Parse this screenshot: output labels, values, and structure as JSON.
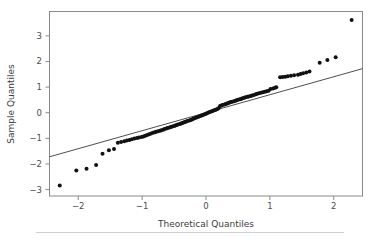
{
  "chart_data": {
    "type": "scatter",
    "title": "",
    "subtitle": "",
    "xlabel": "Theoretical Quantiles",
    "ylabel": "Sample Quantiles",
    "xlim": [
      -2.45,
      2.45
    ],
    "ylim": [
      -3.25,
      3.95
    ],
    "xticks": [
      -2,
      -1,
      0,
      1,
      2
    ],
    "xticklabels": [
      "−2",
      "−1",
      "0",
      "1",
      "2"
    ],
    "yticks": [
      -3,
      -2,
      -1,
      0,
      1,
      2,
      3
    ],
    "yticklabels": [
      "−3",
      "−2",
      "−1",
      "0",
      "1",
      "2",
      "3"
    ],
    "grid": false,
    "legend": "none",
    "marker_color": "#111111",
    "marker_size": 4,
    "line_color": "#3a3a3a",
    "reference_line": {
      "name": "qq-reference-line",
      "x": [
        -2.45,
        2.45
      ],
      "y": [
        -1.72,
        1.72
      ],
      "slope": 0.702,
      "intercept": 0.0
    },
    "series": [
      {
        "name": "sample-quantiles",
        "points": [
          [
            -2.29,
            -2.84
          ],
          [
            -2.03,
            -2.25
          ],
          [
            -1.87,
            -2.19
          ],
          [
            -1.72,
            -2.04
          ],
          [
            -1.62,
            -1.6
          ],
          [
            -1.52,
            -1.46
          ],
          [
            -1.44,
            -1.42
          ],
          [
            -1.38,
            -1.17
          ],
          [
            -1.33,
            -1.14
          ],
          [
            -1.28,
            -1.11
          ],
          [
            -1.24,
            -1.08
          ],
          [
            -1.2,
            -1.06
          ],
          [
            -1.16,
            -1.04
          ],
          [
            -1.12,
            -1.01
          ],
          [
            -1.08,
            -0.99
          ],
          [
            -1.05,
            -0.97
          ],
          [
            -1.01,
            -0.95
          ],
          [
            -0.98,
            -0.93
          ],
          [
            -0.95,
            -0.9
          ],
          [
            -0.92,
            -0.87
          ],
          [
            -0.89,
            -0.84
          ],
          [
            -0.86,
            -0.81
          ],
          [
            -0.83,
            -0.78
          ],
          [
            -0.8,
            -0.76
          ],
          [
            -0.78,
            -0.74
          ],
          [
            -0.75,
            -0.72
          ],
          [
            -0.72,
            -0.7
          ],
          [
            -0.7,
            -0.68
          ],
          [
            -0.67,
            -0.66
          ],
          [
            -0.65,
            -0.64
          ],
          [
            -0.62,
            -0.62
          ],
          [
            -0.6,
            -0.6
          ],
          [
            -0.57,
            -0.58
          ],
          [
            -0.55,
            -0.56
          ],
          [
            -0.53,
            -0.54
          ],
          [
            -0.5,
            -0.52
          ],
          [
            -0.48,
            -0.5
          ],
          [
            -0.46,
            -0.48
          ],
          [
            -0.44,
            -0.46
          ],
          [
            -0.41,
            -0.44
          ],
          [
            -0.39,
            -0.42
          ],
          [
            -0.37,
            -0.4
          ],
          [
            -0.35,
            -0.38
          ],
          [
            -0.33,
            -0.36
          ],
          [
            -0.31,
            -0.34
          ],
          [
            -0.29,
            -0.32
          ],
          [
            -0.26,
            -0.3
          ],
          [
            -0.24,
            -0.28
          ],
          [
            -0.22,
            -0.26
          ],
          [
            -0.2,
            -0.24
          ],
          [
            -0.18,
            -0.22
          ],
          [
            -0.16,
            -0.2
          ],
          [
            -0.14,
            -0.18
          ],
          [
            -0.12,
            -0.16
          ],
          [
            -0.1,
            -0.14
          ],
          [
            -0.08,
            -0.12
          ],
          [
            -0.06,
            -0.1
          ],
          [
            -0.04,
            -0.08
          ],
          [
            -0.02,
            -0.06
          ],
          [
            0.0,
            -0.04
          ],
          [
            0.02,
            -0.01
          ],
          [
            0.04,
            0.01
          ],
          [
            0.06,
            0.03
          ],
          [
            0.08,
            0.05
          ],
          [
            0.1,
            0.07
          ],
          [
            0.12,
            0.09
          ],
          [
            0.14,
            0.11
          ],
          [
            0.16,
            0.13
          ],
          [
            0.18,
            0.15
          ],
          [
            0.2,
            0.18
          ],
          [
            0.22,
            0.26
          ],
          [
            0.24,
            0.28
          ],
          [
            0.26,
            0.3
          ],
          [
            0.29,
            0.32
          ],
          [
            0.31,
            0.34
          ],
          [
            0.33,
            0.36
          ],
          [
            0.35,
            0.38
          ],
          [
            0.37,
            0.4
          ],
          [
            0.39,
            0.42
          ],
          [
            0.41,
            0.43
          ],
          [
            0.44,
            0.45
          ],
          [
            0.46,
            0.47
          ],
          [
            0.48,
            0.49
          ],
          [
            0.5,
            0.51
          ],
          [
            0.53,
            0.53
          ],
          [
            0.55,
            0.54
          ],
          [
            0.57,
            0.56
          ],
          [
            0.6,
            0.58
          ],
          [
            0.62,
            0.6
          ],
          [
            0.65,
            0.62
          ],
          [
            0.67,
            0.63
          ],
          [
            0.7,
            0.65
          ],
          [
            0.72,
            0.67
          ],
          [
            0.75,
            0.69
          ],
          [
            0.78,
            0.72
          ],
          [
            0.8,
            0.74
          ],
          [
            0.83,
            0.76
          ],
          [
            0.86,
            0.78
          ],
          [
            0.89,
            0.8
          ],
          [
            0.92,
            0.82
          ],
          [
            0.95,
            0.84
          ],
          [
            0.98,
            0.86
          ],
          [
            1.01,
            0.93
          ],
          [
            1.05,
            0.95
          ],
          [
            1.08,
            0.97
          ],
          [
            1.1,
            0.99
          ],
          [
            1.16,
            1.38
          ],
          [
            1.2,
            1.39
          ],
          [
            1.24,
            1.4
          ],
          [
            1.28,
            1.42
          ],
          [
            1.33,
            1.44
          ],
          [
            1.38,
            1.46
          ],
          [
            1.44,
            1.48
          ],
          [
            1.48,
            1.51
          ],
          [
            1.52,
            1.54
          ],
          [
            1.57,
            1.57
          ],
          [
            1.62,
            1.61
          ],
          [
            1.78,
            1.95
          ],
          [
            1.9,
            2.06
          ],
          [
            2.03,
            2.16
          ],
          [
            2.28,
            3.62
          ]
        ]
      }
    ]
  }
}
